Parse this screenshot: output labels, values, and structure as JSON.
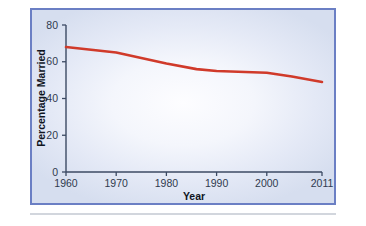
{
  "figure": {
    "frame_border_color": "#6b7fc4",
    "background_tint": "#e4e9f6",
    "separator_color": "#d2d6dd"
  },
  "chart_data": {
    "type": "line",
    "title": "",
    "xlabel": "Year",
    "ylabel": "Percentage Married",
    "x": [
      1960,
      1970,
      1980,
      1986,
      1990,
      2000,
      2005,
      2011
    ],
    "values": [
      68,
      65,
      59,
      56,
      55,
      54,
      52,
      49
    ],
    "xticks": [
      "1960",
      "1970",
      "1980",
      "1990",
      "2000",
      "2011"
    ],
    "xtick_values": [
      1960,
      1970,
      1980,
      1990,
      2000,
      2011
    ],
    "yticks": [
      "0",
      "20",
      "40",
      "60",
      "80"
    ],
    "ytick_values": [
      0,
      20,
      40,
      60,
      80
    ],
    "xlim": [
      1960,
      2011
    ],
    "ylim": [
      0,
      80
    ],
    "line_color": "#d03a2a",
    "axis_color": "#3c4a63",
    "grid": false,
    "legend": false,
    "series": [
      {
        "name": "Percentage Married",
        "values": [
          68,
          65,
          59,
          56,
          55,
          54,
          52,
          49
        ]
      }
    ]
  }
}
